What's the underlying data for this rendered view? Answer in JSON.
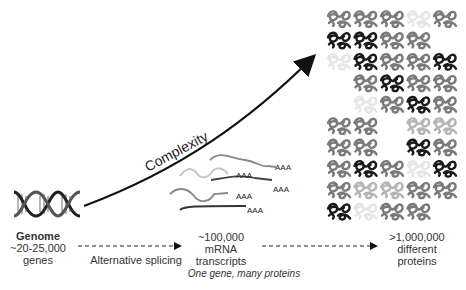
{
  "genome": {
    "title": "Genome",
    "count": "~20-25,000",
    "unit": "genes"
  },
  "mrna": {
    "count": "~100,000",
    "line2": "mRNA",
    "line3": "transcripts",
    "tail_label": "AAA"
  },
  "proteins": {
    "count": ">1,000,000",
    "line2": "different",
    "line3": "proteins"
  },
  "arrows": {
    "splicing_label": "Alternative splicing",
    "complexity_label": "Complexity"
  },
  "caption": "One gene, many proteins",
  "colors": {
    "dark": "#1a1a1a",
    "mid": "#7a7a7a",
    "light": "#b5b5b5",
    "faint": "#e6e6e6"
  },
  "protein_grid": {
    "columns": 5,
    "rows": 10,
    "shades": [
      [
        "mid",
        "mid",
        "mid",
        "faint",
        "mid"
      ],
      [
        "dark",
        "dark",
        "mid",
        "mid",
        "none"
      ],
      [
        "faint",
        "dark",
        "mid",
        "mid",
        "dark"
      ],
      [
        "none",
        "mid",
        "dark",
        "mid",
        "mid"
      ],
      [
        "none",
        "faint",
        "mid",
        "dark",
        "mid"
      ],
      [
        "mid",
        "mid",
        "none",
        "light",
        "light"
      ],
      [
        "mid",
        "mid",
        "none",
        "dark",
        "mid"
      ],
      [
        "mid",
        "dark",
        "mid",
        "faint",
        "dark"
      ],
      [
        "mid",
        "light",
        "light",
        "mid",
        "mid"
      ],
      [
        "dark",
        "faint",
        "mid",
        "mid",
        "none"
      ]
    ]
  }
}
